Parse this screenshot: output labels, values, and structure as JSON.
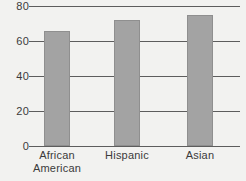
{
  "chart_data": {
    "type": "bar",
    "title": "",
    "subtitle": "",
    "xlabel": "",
    "ylabel": "",
    "categories": [
      "African\nAmerican",
      "Hispanic",
      "Asian"
    ],
    "values": [
      66,
      72,
      75
    ],
    "ylim": [
      0,
      80
    ],
    "yticks": [
      0,
      20,
      40,
      60,
      80
    ],
    "ytick_labels": [
      "0",
      "20",
      "40",
      "60",
      "80"
    ],
    "grid": true,
    "grid_axis": "y",
    "legend": false,
    "legend_position": "none",
    "bar_color": "#a3a3a3",
    "bar_edge_color": "#8f8f8f",
    "grid_color": "#5d5d5d",
    "text_color": "#3b3b3b",
    "background_color": "#f2f2f0"
  }
}
